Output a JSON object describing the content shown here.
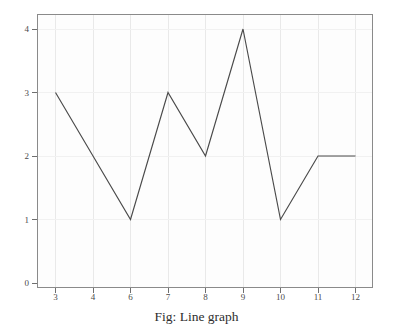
{
  "figure": {
    "caption": "Fig: Line graph",
    "background_color": "#ffffff",
    "frame_color": "#8a8a8a",
    "line_color": "#4a4a4a",
    "grid_color": "#e9e9e9"
  },
  "chart_data": {
    "type": "line",
    "title": "Fig: Line graph",
    "xlabel": "",
    "ylabel": "",
    "categories": [
      "3",
      "4",
      "6",
      "7",
      "8",
      "9",
      "10",
      "11",
      "12"
    ],
    "values": [
      3,
      2,
      1,
      3,
      2,
      4,
      1,
      2,
      2
    ],
    "series": [
      {
        "name": "series-1",
        "values": [
          3,
          2,
          1,
          3,
          2,
          4,
          1,
          2,
          2
        ]
      }
    ],
    "x_tick_labels": [
      "3",
      "4",
      "6",
      "7",
      "8",
      "9",
      "10",
      "11",
      "12"
    ],
    "y_tick_labels": [
      "0",
      "1",
      "2",
      "3",
      "4"
    ],
    "y_ticks": [
      0,
      1,
      2,
      3,
      4
    ],
    "ylim": [
      0,
      4.3
    ],
    "grid": true,
    "legend": false,
    "markers": false
  }
}
